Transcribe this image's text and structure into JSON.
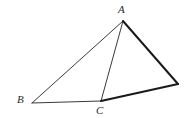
{
  "figure": {
    "type": "geometry-diagram",
    "width": 193,
    "height": 118,
    "background_color": "#ffffff",
    "thin_stroke_color": "#3a3a3a",
    "thick_stroke_color": "#1a1a1a",
    "thin_stroke_width": 1,
    "thick_stroke_width": 2,
    "vertices": [
      {
        "id": "A",
        "label": "A",
        "x": 123,
        "y": 21,
        "label_x": 118,
        "label_y": 4,
        "labeled": true
      },
      {
        "id": "B",
        "label": "B",
        "x": 32,
        "y": 103,
        "label_x": 17,
        "label_y": 94,
        "labeled": true
      },
      {
        "id": "C",
        "label": "C",
        "x": 101,
        "y": 101,
        "label_x": 96,
        "label_y": 105,
        "labeled": true
      },
      {
        "id": "D",
        "label": "",
        "x": 178,
        "y": 84,
        "label_x": 0,
        "label_y": 0,
        "labeled": false
      }
    ],
    "edges": [
      {
        "id": "AB",
        "from": "A",
        "to": "B",
        "weight": "thin",
        "x1": 123,
        "y1": 21,
        "x2": 32,
        "y2": 103
      },
      {
        "id": "AC",
        "from": "A",
        "to": "C",
        "weight": "thin",
        "x1": 123,
        "y1": 21,
        "x2": 101,
        "y2": 101
      },
      {
        "id": "BC",
        "from": "B",
        "to": "C",
        "weight": "thin",
        "x1": 32,
        "y1": 103,
        "x2": 101,
        "y2": 101
      },
      {
        "id": "AD",
        "from": "A",
        "to": "D",
        "weight": "thick",
        "x1": 123,
        "y1": 21,
        "x2": 178,
        "y2": 84
      },
      {
        "id": "CD",
        "from": "C",
        "to": "D",
        "weight": "thick",
        "x1": 101,
        "y1": 101,
        "x2": 178,
        "y2": 84
      }
    ]
  }
}
